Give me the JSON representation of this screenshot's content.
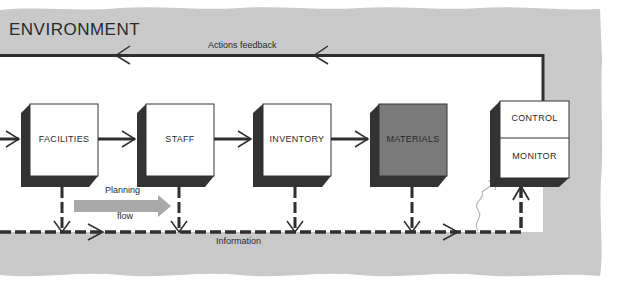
{
  "environment": {
    "title": "ENVIRONMENT",
    "background_color": "#c9c9c9"
  },
  "feedback": {
    "label": "Actions feedback"
  },
  "information": {
    "label": "Information"
  },
  "planning_flow": {
    "line1": "Planning",
    "line2": "flow",
    "color": "#a9a9a9"
  },
  "boxes": [
    {
      "id": "facilities",
      "label": "FACILITIES",
      "fill": "#ffffff"
    },
    {
      "id": "staff",
      "label": "STAFF",
      "fill": "#ffffff"
    },
    {
      "id": "inventory",
      "label": "INVENTORY",
      "fill": "#ffffff"
    },
    {
      "id": "materials",
      "label": "MATERIALS",
      "fill": "#7a7a7a"
    }
  ],
  "control_box": {
    "top_label": "CONTROL",
    "bottom_label": "MONITOR"
  },
  "colors": {
    "line": "#2f2f2f",
    "shadow": "#333333"
  }
}
